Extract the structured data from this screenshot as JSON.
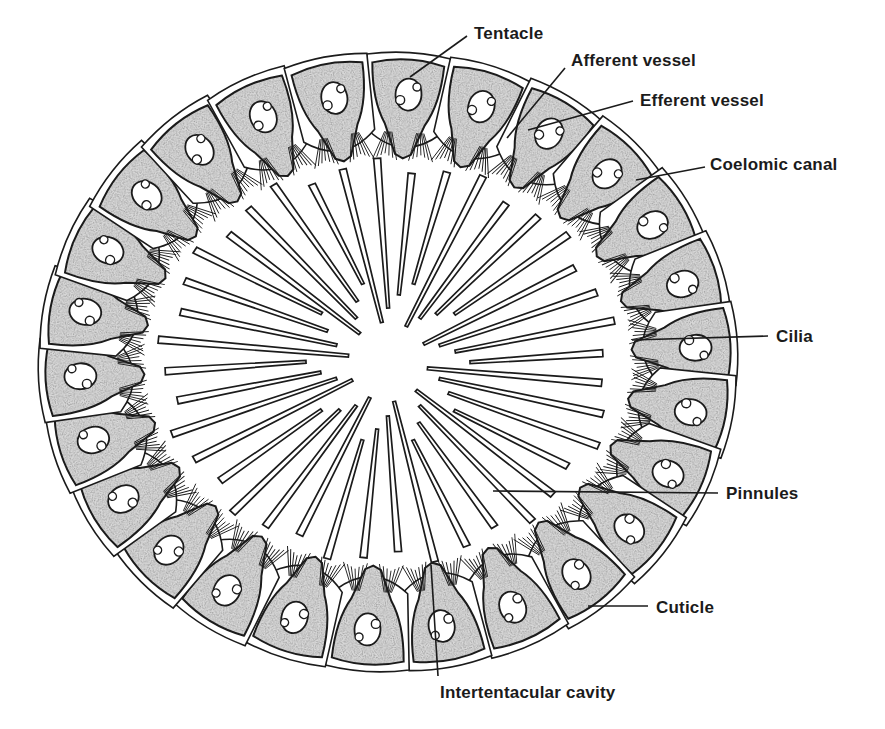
{
  "figure": {
    "background": "#ffffff",
    "ink_color": "#1b1b1b",
    "stipple_color": "#6b6b6b",
    "center": [
      388,
      362
    ],
    "tentacle_count": 26,
    "pinnule_count": 40
  },
  "labels": [
    {
      "id": "tentacle",
      "text": "Tentacle",
      "x": 474,
      "y": 25,
      "line": [
        [
          467,
          36
        ],
        [
          410,
          77
        ]
      ]
    },
    {
      "id": "afferent-vessel",
      "text": "Afferent vessel",
      "x": 571,
      "y": 52,
      "line": [
        [
          565,
          68
        ],
        [
          507,
          138
        ]
      ]
    },
    {
      "id": "efferent-vessel",
      "text": "Efferent vessel",
      "x": 640,
      "y": 92,
      "line": [
        [
          633,
          101
        ],
        [
          528,
          130
        ]
      ]
    },
    {
      "id": "coelomic-canal",
      "text": "Coelomic canal",
      "x": 710,
      "y": 156,
      "line": [
        [
          705,
          167
        ],
        [
          636,
          180
        ]
      ]
    },
    {
      "id": "cilia",
      "text": "Cilia",
      "x": 776,
      "y": 328,
      "line": [
        [
          768,
          336
        ],
        [
          632,
          340
        ]
      ]
    },
    {
      "id": "pinnules",
      "text": "Pinnules",
      "x": 726,
      "y": 485,
      "line": [
        [
          718,
          493
        ],
        [
          493,
          491
        ]
      ]
    },
    {
      "id": "cuticle",
      "text": "Cuticle",
      "x": 656,
      "y": 599,
      "line": [
        [
          648,
          606
        ],
        [
          588,
          606
        ]
      ]
    },
    {
      "id": "intertentacular-cavity",
      "text": "Intertentacular cavity",
      "x": 440,
      "y": 684,
      "line": [
        [
          438,
          676
        ],
        [
          431,
          565
        ]
      ]
    }
  ],
  "caption_fragment": ""
}
